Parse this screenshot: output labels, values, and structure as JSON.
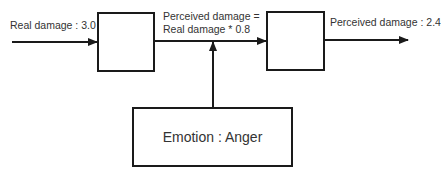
{
  "diagram": {
    "input_label": "Real damage : 3.0",
    "middle_label_line1": "Perceived damage =",
    "middle_label_line2": "Real damage * 0.8",
    "output_label": "Perceived damage : 2.4",
    "emotion_box_label": "Emotion : Anger",
    "line_color": "#1a1a1a"
  }
}
